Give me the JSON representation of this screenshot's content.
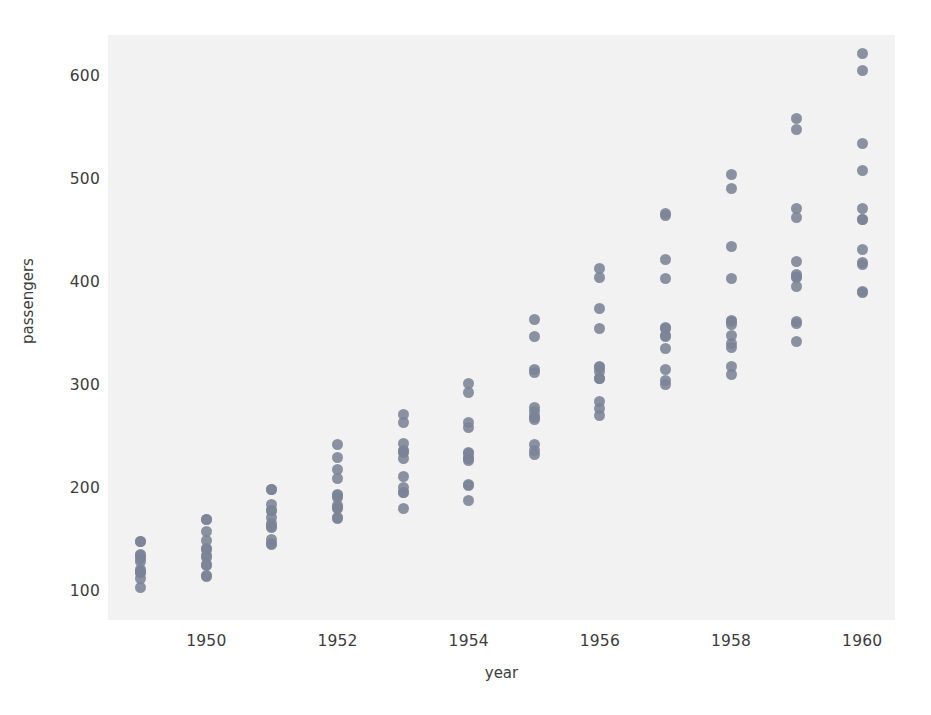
{
  "chart_data": {
    "type": "scatter",
    "title": "",
    "xlabel": "year",
    "ylabel": "passengers",
    "xlim": [
      1948.5,
      1960.5
    ],
    "ylim": [
      72,
      640
    ],
    "grid": false,
    "legend": null,
    "xticks": [
      "1950",
      "1952",
      "1954",
      "1956",
      "1958",
      "1960"
    ],
    "xtick_values": [
      1950,
      1952,
      1954,
      1956,
      1958,
      1960
    ],
    "yticks": [
      "100",
      "200",
      "300",
      "400",
      "500",
      "600"
    ],
    "ytick_values": [
      100,
      200,
      300,
      400,
      500,
      600
    ],
    "marker_color": "#7b8496",
    "background_color": "#f2f2f2",
    "categories": [
      1949,
      1950,
      1951,
      1952,
      1953,
      1954,
      1955,
      1956,
      1957,
      1958,
      1959,
      1960
    ],
    "series": [
      {
        "name": "passengers",
        "points": [
          {
            "x": 1949,
            "y": 112
          },
          {
            "x": 1949,
            "y": 118
          },
          {
            "x": 1949,
            "y": 132
          },
          {
            "x": 1949,
            "y": 129
          },
          {
            "x": 1949,
            "y": 121
          },
          {
            "x": 1949,
            "y": 135
          },
          {
            "x": 1949,
            "y": 148
          },
          {
            "x": 1949,
            "y": 148
          },
          {
            "x": 1949,
            "y": 136
          },
          {
            "x": 1949,
            "y": 119
          },
          {
            "x": 1949,
            "y": 104
          },
          {
            "x": 1949,
            "y": 118
          },
          {
            "x": 1950,
            "y": 115
          },
          {
            "x": 1950,
            "y": 126
          },
          {
            "x": 1950,
            "y": 141
          },
          {
            "x": 1950,
            "y": 135
          },
          {
            "x": 1950,
            "y": 125
          },
          {
            "x": 1950,
            "y": 149
          },
          {
            "x": 1950,
            "y": 170
          },
          {
            "x": 1950,
            "y": 170
          },
          {
            "x": 1950,
            "y": 158
          },
          {
            "x": 1950,
            "y": 133
          },
          {
            "x": 1950,
            "y": 114
          },
          {
            "x": 1950,
            "y": 140
          },
          {
            "x": 1951,
            "y": 145
          },
          {
            "x": 1951,
            "y": 150
          },
          {
            "x": 1951,
            "y": 178
          },
          {
            "x": 1951,
            "y": 163
          },
          {
            "x": 1951,
            "y": 172
          },
          {
            "x": 1951,
            "y": 178
          },
          {
            "x": 1951,
            "y": 199
          },
          {
            "x": 1951,
            "y": 199
          },
          {
            "x": 1951,
            "y": 184
          },
          {
            "x": 1951,
            "y": 162
          },
          {
            "x": 1951,
            "y": 146
          },
          {
            "x": 1951,
            "y": 166
          },
          {
            "x": 1952,
            "y": 171
          },
          {
            "x": 1952,
            "y": 180
          },
          {
            "x": 1952,
            "y": 193
          },
          {
            "x": 1952,
            "y": 181
          },
          {
            "x": 1952,
            "y": 183
          },
          {
            "x": 1952,
            "y": 218
          },
          {
            "x": 1952,
            "y": 230
          },
          {
            "x": 1952,
            "y": 242
          },
          {
            "x": 1952,
            "y": 209
          },
          {
            "x": 1952,
            "y": 191
          },
          {
            "x": 1952,
            "y": 172
          },
          {
            "x": 1952,
            "y": 194
          },
          {
            "x": 1953,
            "y": 196
          },
          {
            "x": 1953,
            "y": 196
          },
          {
            "x": 1953,
            "y": 236
          },
          {
            "x": 1953,
            "y": 235
          },
          {
            "x": 1953,
            "y": 229
          },
          {
            "x": 1953,
            "y": 243
          },
          {
            "x": 1953,
            "y": 264
          },
          {
            "x": 1953,
            "y": 272
          },
          {
            "x": 1953,
            "y": 237
          },
          {
            "x": 1953,
            "y": 211
          },
          {
            "x": 1953,
            "y": 180
          },
          {
            "x": 1953,
            "y": 201
          },
          {
            "x": 1954,
            "y": 204
          },
          {
            "x": 1954,
            "y": 188
          },
          {
            "x": 1954,
            "y": 235
          },
          {
            "x": 1954,
            "y": 227
          },
          {
            "x": 1954,
            "y": 234
          },
          {
            "x": 1954,
            "y": 264
          },
          {
            "x": 1954,
            "y": 302
          },
          {
            "x": 1954,
            "y": 293
          },
          {
            "x": 1954,
            "y": 259
          },
          {
            "x": 1954,
            "y": 229
          },
          {
            "x": 1954,
            "y": 203
          },
          {
            "x": 1954,
            "y": 229
          },
          {
            "x": 1955,
            "y": 242
          },
          {
            "x": 1955,
            "y": 233
          },
          {
            "x": 1955,
            "y": 267
          },
          {
            "x": 1955,
            "y": 269
          },
          {
            "x": 1955,
            "y": 270
          },
          {
            "x": 1955,
            "y": 315
          },
          {
            "x": 1955,
            "y": 364
          },
          {
            "x": 1955,
            "y": 347
          },
          {
            "x": 1955,
            "y": 312
          },
          {
            "x": 1955,
            "y": 274
          },
          {
            "x": 1955,
            "y": 237
          },
          {
            "x": 1955,
            "y": 278
          },
          {
            "x": 1956,
            "y": 284
          },
          {
            "x": 1956,
            "y": 277
          },
          {
            "x": 1956,
            "y": 317
          },
          {
            "x": 1956,
            "y": 313
          },
          {
            "x": 1956,
            "y": 318
          },
          {
            "x": 1956,
            "y": 374
          },
          {
            "x": 1956,
            "y": 413
          },
          {
            "x": 1956,
            "y": 405
          },
          {
            "x": 1956,
            "y": 355
          },
          {
            "x": 1956,
            "y": 306
          },
          {
            "x": 1956,
            "y": 271
          },
          {
            "x": 1956,
            "y": 306
          },
          {
            "x": 1957,
            "y": 315
          },
          {
            "x": 1957,
            "y": 301
          },
          {
            "x": 1957,
            "y": 356
          },
          {
            "x": 1957,
            "y": 348
          },
          {
            "x": 1957,
            "y": 355
          },
          {
            "x": 1957,
            "y": 422
          },
          {
            "x": 1957,
            "y": 465
          },
          {
            "x": 1957,
            "y": 467
          },
          {
            "x": 1957,
            "y": 404
          },
          {
            "x": 1957,
            "y": 347
          },
          {
            "x": 1957,
            "y": 305
          },
          {
            "x": 1957,
            "y": 336
          },
          {
            "x": 1958,
            "y": 340
          },
          {
            "x": 1958,
            "y": 318
          },
          {
            "x": 1958,
            "y": 362
          },
          {
            "x": 1958,
            "y": 348
          },
          {
            "x": 1958,
            "y": 363
          },
          {
            "x": 1958,
            "y": 435
          },
          {
            "x": 1958,
            "y": 491
          },
          {
            "x": 1958,
            "y": 505
          },
          {
            "x": 1958,
            "y": 404
          },
          {
            "x": 1958,
            "y": 359
          },
          {
            "x": 1958,
            "y": 310
          },
          {
            "x": 1958,
            "y": 337
          },
          {
            "x": 1959,
            "y": 360
          },
          {
            "x": 1959,
            "y": 342
          },
          {
            "x": 1959,
            "y": 406
          },
          {
            "x": 1959,
            "y": 396
          },
          {
            "x": 1959,
            "y": 420
          },
          {
            "x": 1959,
            "y": 472
          },
          {
            "x": 1959,
            "y": 548
          },
          {
            "x": 1959,
            "y": 559
          },
          {
            "x": 1959,
            "y": 463
          },
          {
            "x": 1959,
            "y": 407
          },
          {
            "x": 1959,
            "y": 362
          },
          {
            "x": 1959,
            "y": 405
          },
          {
            "x": 1960,
            "y": 417
          },
          {
            "x": 1960,
            "y": 391
          },
          {
            "x": 1960,
            "y": 419
          },
          {
            "x": 1960,
            "y": 461
          },
          {
            "x": 1960,
            "y": 472
          },
          {
            "x": 1960,
            "y": 535
          },
          {
            "x": 1960,
            "y": 622
          },
          {
            "x": 1960,
            "y": 606
          },
          {
            "x": 1960,
            "y": 508
          },
          {
            "x": 1960,
            "y": 461
          },
          {
            "x": 1960,
            "y": 390
          },
          {
            "x": 1960,
            "y": 432
          }
        ]
      }
    ]
  }
}
